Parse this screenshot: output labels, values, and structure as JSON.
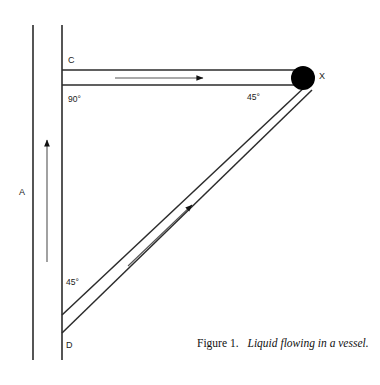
{
  "figure": {
    "caption_number": "Figure 1.",
    "caption_text": "Liquid flowing in a vessel.",
    "stroke_color": "#1a1a1a",
    "fill_color": "#000000",
    "background_color": "#ffffff"
  },
  "labels": {
    "vertical_channel": "A",
    "top_corner": "C",
    "bottom_corner": "D",
    "junction_point": "X",
    "angle_top_left": "90°",
    "angle_at_x": "45°",
    "angle_at_d": "45°"
  },
  "geometry": {
    "vertical_wall_outer_x": 33,
    "vertical_wall_inner_x": 62,
    "vertical_wall_top_y": 25,
    "vertical_wall_bottom_y": 360,
    "horizontal_top_y": 70,
    "horizontal_bottom_y": 85,
    "junction_center_x": 303,
    "junction_center_y": 78,
    "junction_radius": 12,
    "diagonal_upper_end_y": 315,
    "diagonal_lower_end_y": 333,
    "flow_arrow_vertical": "up",
    "flow_arrow_horizontal": "right",
    "flow_arrow_diagonal": "up-right"
  }
}
